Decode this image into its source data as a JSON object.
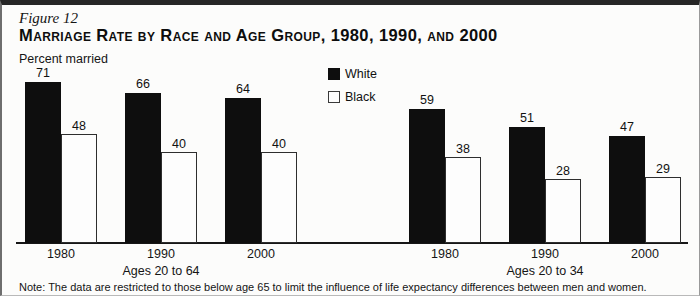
{
  "figure": {
    "label": "Figure 12",
    "title": "Marriage Rate by Race and Age Group, 1980, 1990, and 2000",
    "y_axis_label": "Percent married",
    "note": "Note: The data are restricted to those below age 65 to limit the influence of life expectancy differences between men and women."
  },
  "legend": {
    "items": [
      {
        "label": "White",
        "swatch": "filled-black-square"
      },
      {
        "label": "Black",
        "swatch": "outlined-white-square"
      }
    ]
  },
  "chart_data": {
    "type": "bar",
    "title": "Marriage Rate by Race and Age Group, 1980, 1990, and 2000",
    "xlabel": "",
    "ylabel": "Percent married",
    "unit": "percent",
    "ylim": [
      0,
      75
    ],
    "grid": false,
    "bar_labels": true,
    "legend_position": "top-center",
    "colors": {
      "White": "#0e0e0e",
      "Black": "#fdfdfd"
    },
    "groups": [
      {
        "label": "Ages 20 to 64",
        "categories": [
          "1980",
          "1990",
          "2000"
        ],
        "series": [
          {
            "name": "White",
            "values": [
              71,
              66,
              64
            ]
          },
          {
            "name": "Black",
            "values": [
              48,
              40,
              40
            ]
          }
        ]
      },
      {
        "label": "Ages 20 to 34",
        "categories": [
          "1980",
          "1990",
          "2000"
        ],
        "series": [
          {
            "name": "White",
            "values": [
              59,
              51,
              47
            ]
          },
          {
            "name": "Black",
            "values": [
              38,
              28,
              29
            ]
          }
        ]
      }
    ]
  }
}
